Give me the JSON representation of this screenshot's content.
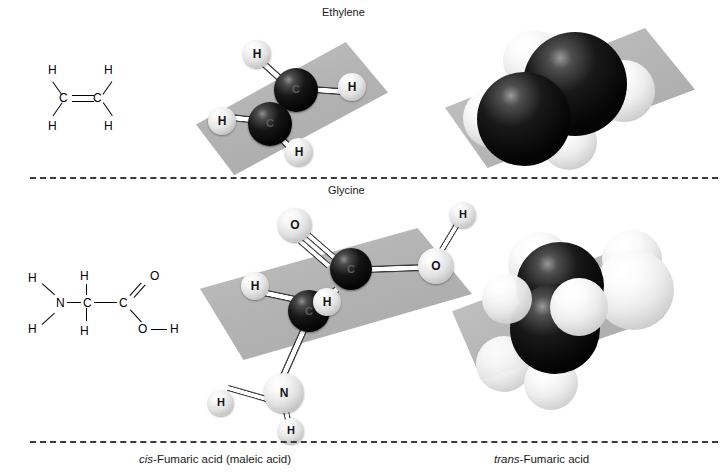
{
  "figure": {
    "background": "#ffffff",
    "plane_color": "#b5b5b5",
    "carbon_color": "#000000",
    "hydrogen_color": "#ffffff",
    "bond_color": "#ffffff"
  },
  "labels": {
    "top": "Ethylene",
    "middle": "Glycine"
  },
  "captions": {
    "left_italic": "cis",
    "left_rest": "-Fumaric acid (maleic acid)",
    "right_italic": "trans",
    "right_rest": "-Fumaric acid"
  },
  "skeletal": {
    "ethylene": {
      "atoms": [
        {
          "text": "H",
          "x": 13,
          "y": 2
        },
        {
          "text": "H",
          "x": 69,
          "y": 2
        },
        {
          "text": "C",
          "x": 24,
          "y": 30
        },
        {
          "text": "C",
          "x": 58,
          "y": 30
        },
        {
          "text": "H",
          "x": 13,
          "y": 58
        },
        {
          "text": "H",
          "x": 69,
          "y": 58
        }
      ],
      "bond_note": "C=C double bond with four C-H single bonds"
    },
    "glycine": {
      "atoms": [
        {
          "text": "H",
          "x": 6,
          "y": 6
        },
        {
          "text": "H",
          "x": 58,
          "y": 4
        },
        {
          "text": "O",
          "x": 128,
          "y": 4
        },
        {
          "text": "N",
          "x": 34,
          "y": 31
        },
        {
          "text": "C",
          "x": 61,
          "y": 31
        },
        {
          "text": "C",
          "x": 97,
          "y": 31
        },
        {
          "text": "H",
          "x": 6,
          "y": 57
        },
        {
          "text": "H",
          "x": 58,
          "y": 59
        },
        {
          "text": "O",
          "x": 116,
          "y": 57
        },
        {
          "text": "H",
          "x": 148,
          "y": 57
        }
      ],
      "bond_note": "H2N-CH2-C(=O)-O-H"
    }
  },
  "models": {
    "ethylene_ball_stick": {
      "type": "ball-and-stick",
      "atom_labels": [
        "H",
        "C",
        "C",
        "H",
        "H",
        "H"
      ],
      "spheres": [
        {
          "el": "H",
          "kind": "w",
          "x": 47,
          "y": 12,
          "d": 28
        },
        {
          "el": "C",
          "kind": "c",
          "x": 78,
          "y": 40,
          "d": 44
        },
        {
          "el": "H",
          "kind": "w",
          "x": 142,
          "y": 45,
          "d": 28
        },
        {
          "el": "C",
          "kind": "c",
          "x": 52,
          "y": 74,
          "d": 44
        },
        {
          "el": "H",
          "kind": "w",
          "x": 12,
          "y": 79,
          "d": 28
        },
        {
          "el": "H",
          "kind": "w",
          "x": 89,
          "y": 110,
          "d": 28
        }
      ],
      "rods": [
        {
          "x1": 64,
          "y1": 30,
          "x2": 92,
          "y2": 55,
          "w": 7
        },
        {
          "x1": 118,
          "y1": 58,
          "x2": 150,
          "y2": 60,
          "w": 7
        },
        {
          "x1": 72,
          "y1": 86,
          "x2": 33,
          "y2": 92,
          "w": 7
        },
        {
          "x1": 88,
          "y1": 110,
          "x2": 101,
          "y2": 122,
          "w": 7
        },
        {
          "x1": 85,
          "y1": 78,
          "x2": 92,
          "y2": 69,
          "w": 6
        },
        {
          "x1": 79,
          "y1": 84,
          "x2": 86,
          "y2": 75,
          "w": 6
        }
      ]
    },
    "ethylene_space_fill": {
      "type": "space-filling",
      "spheres": [
        {
          "el": "H",
          "kind": "w",
          "x": 58,
          "y": 10,
          "d": 60
        },
        {
          "el": "H",
          "kind": "w",
          "x": 138,
          "y": 40,
          "d": 62
        },
        {
          "el": "H",
          "kind": "w",
          "x": 12,
          "y": 62,
          "d": 60
        },
        {
          "el": "C",
          "kind": "c",
          "x": 66,
          "y": 14,
          "d": 100
        },
        {
          "el": "C",
          "kind": "c",
          "x": 22,
          "y": 58,
          "d": 92
        },
        {
          "el": "H",
          "kind": "w",
          "x": 84,
          "y": 92,
          "d": 54
        }
      ]
    },
    "glycine_ball_stick": {
      "type": "ball-and-stick",
      "atom_labels": [
        "O",
        "C",
        "O",
        "H",
        "C",
        "H",
        "H",
        "N",
        "H",
        "H"
      ],
      "spheres": [
        {
          "el": "O",
          "kind": "w",
          "x": 78,
          "y": 8,
          "d": 34
        },
        {
          "el": "H",
          "kind": "w",
          "x": 250,
          "y": 2,
          "d": 26
        },
        {
          "el": "C",
          "kind": "c",
          "x": 130,
          "y": 48,
          "d": 42
        },
        {
          "el": "O",
          "kind": "w",
          "x": 218,
          "y": 48,
          "d": 36
        },
        {
          "el": "H",
          "kind": "w",
          "x": 41,
          "y": 72,
          "d": 28
        },
        {
          "el": "C",
          "kind": "c",
          "x": 88,
          "y": 90,
          "d": 42
        },
        {
          "el": "H",
          "kind": "w",
          "x": 113,
          "y": 88,
          "d": 28
        },
        {
          "el": "N",
          "kind": "w",
          "x": 64,
          "y": 173,
          "d": 40
        },
        {
          "el": "H",
          "kind": "w",
          "x": 8,
          "y": 196,
          "d": 26
        },
        {
          "el": "H",
          "kind": "w",
          "x": 78,
          "y": 222,
          "d": 26
        }
      ],
      "rods": [
        {
          "x1": 108,
          "y1": 32,
          "x2": 136,
          "y2": 56,
          "w": 6
        },
        {
          "x1": 102,
          "y1": 38,
          "x2": 130,
          "y2": 62,
          "w": 6
        },
        {
          "x1": 170,
          "y1": 66,
          "x2": 222,
          "y2": 64,
          "w": 7
        },
        {
          "x1": 240,
          "y1": 48,
          "x2": 256,
          "y2": 22,
          "w": 6
        },
        {
          "x1": 124,
          "y1": 100,
          "x2": 66,
          "y2": 88,
          "w": 7
        },
        {
          "x1": 122,
          "y1": 98,
          "x2": 136,
          "y2": 86,
          "w": 7
        },
        {
          "x1": 102,
          "y1": 128,
          "x2": 80,
          "y2": 180,
          "w": 7
        },
        {
          "x1": 68,
          "y1": 196,
          "x2": 30,
          "y2": 208,
          "w": 6
        },
        {
          "x1": 86,
          "y1": 208,
          "x2": 90,
          "y2": 226,
          "w": 6
        }
      ]
    },
    "glycine_space_fill": {
      "type": "space-filling",
      "spheres": [
        {
          "el": "H",
          "kind": "w",
          "x": 24,
          "y": 100,
          "d": 54
        },
        {
          "el": "H",
          "kind": "w",
          "x": 56,
          "y": -4,
          "d": 62
        },
        {
          "el": "H",
          "kind": "w",
          "x": 152,
          "y": -6,
          "d": 58
        },
        {
          "el": "O",
          "kind": "w",
          "x": 146,
          "y": 16,
          "d": 76
        },
        {
          "el": "C",
          "kind": "c",
          "x": 66,
          "y": 8,
          "d": 84
        },
        {
          "el": "C",
          "kind": "c",
          "x": 62,
          "y": 50,
          "d": 86
        },
        {
          "el": "H",
          "kind": "w",
          "x": 100,
          "y": 44,
          "d": 54
        },
        {
          "el": "N",
          "kind": "w",
          "x": 40,
          "y": 108,
          "d": 52
        },
        {
          "el": "H",
          "kind": "w",
          "x": 78,
          "y": 124,
          "d": 50
        }
      ]
    }
  }
}
